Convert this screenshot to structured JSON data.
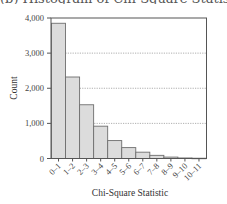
{
  "chart_data": {
    "type": "bar",
    "title": "",
    "xlabel": "Chi-Square Statistic",
    "ylabel": "Count",
    "categories": [
      "0–1",
      "1–2",
      "2–3",
      "3–4",
      "4–5",
      "5–6",
      "6–7",
      "7–8",
      "8–9",
      "9–10",
      "10–11"
    ],
    "values": [
      3850,
      2320,
      1530,
      920,
      510,
      310,
      180,
      90,
      40,
      15,
      8
    ],
    "ylim": [
      0,
      4000
    ],
    "yticks": [
      0,
      1000,
      2000,
      3000,
      4000
    ],
    "ytick_labels": [
      "0",
      "1,000",
      "2,000",
      "3,000",
      "4,000"
    ],
    "grid": "horizontal dotted",
    "legend": "none",
    "bar_color": "#dcdcdc",
    "bar_edge_color": "#6e6e6e"
  },
  "labels": {
    "clipped_title": "(b) Histogram of Chi-Square Statistic)"
  }
}
